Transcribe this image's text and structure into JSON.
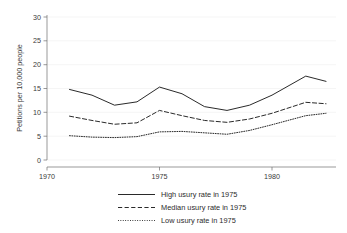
{
  "chart_data": {
    "type": "line",
    "title": "",
    "subtitle": "",
    "xlabel": "",
    "ylabel": "Petitions per 10,000 people",
    "xlim": [
      1970,
      1982.6
    ],
    "ylim": [
      0,
      31
    ],
    "xticks": [
      1970,
      1975,
      1980
    ],
    "xtick_labels": [
      "1970",
      "1975",
      "1980"
    ],
    "yticks": [
      0,
      5,
      10,
      15,
      20,
      25,
      30
    ],
    "ytick_labels": [
      "0",
      "5",
      "10",
      "15",
      "20",
      "25",
      "30"
    ],
    "grid": "faint horizontal gridlines at y ticks",
    "legend_position": "below plot, centered",
    "x": [
      1971,
      1972,
      1973,
      1974,
      1975,
      1976,
      1977,
      1978,
      1979,
      1980,
      1981.5,
      1982.4
    ],
    "series": [
      {
        "name": "High usury rate in 1975",
        "style": "solid",
        "color": "#1f1f1f",
        "values": [
          14.8,
          13.6,
          11.5,
          12.2,
          15.3,
          13.9,
          11.2,
          10.4,
          11.5,
          13.6,
          17.6,
          16.5
        ]
      },
      {
        "name": "Median usury rate in 1975",
        "style": "dashed",
        "color": "#1f1f1f",
        "values": [
          9.2,
          8.3,
          7.5,
          7.8,
          10.4,
          9.3,
          8.3,
          7.9,
          8.6,
          9.8,
          12.1,
          11.8
        ]
      },
      {
        "name": "Low usury rate in 1975",
        "style": "dotted",
        "color": "#1f1f1f",
        "values": [
          5.1,
          4.8,
          4.7,
          4.9,
          5.9,
          6.0,
          5.7,
          5.4,
          6.2,
          7.4,
          9.3,
          9.8
        ]
      }
    ]
  },
  "axes": {
    "y_title": "Petitions per 10,000 people",
    "y_tick_0": "0",
    "y_tick_5": "5",
    "y_tick_10": "10",
    "y_tick_15": "15",
    "y_tick_20": "20",
    "y_tick_25": "25",
    "y_tick_30": "30",
    "x_tick_1970": "1970",
    "x_tick_1975": "1975",
    "x_tick_1980": "1980"
  },
  "legend": {
    "items": [
      {
        "label": "High usury rate in 1975"
      },
      {
        "label": "Median usury rate in 1975"
      },
      {
        "label": "Low usury rate in 1975"
      }
    ]
  }
}
